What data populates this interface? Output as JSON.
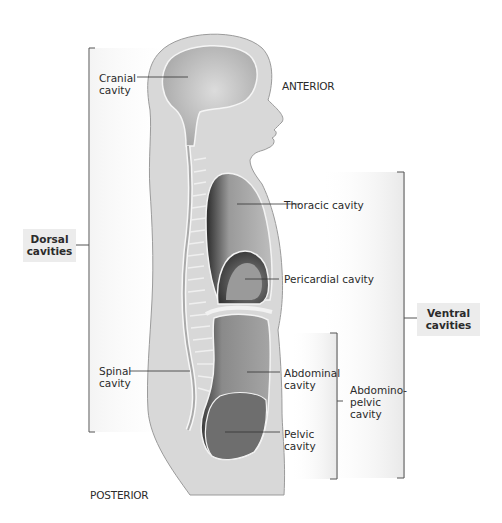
{
  "figure": {
    "orientation": {
      "anterior": "ANTERIOR",
      "posterior": "POSTERIOR"
    },
    "groups": {
      "dorsal": {
        "line1": "Dorsal",
        "line2": "cavities"
      },
      "ventral": {
        "line1": "Ventral",
        "line2": "cavities"
      },
      "abdominopelvic": {
        "line1": "Abdomino-",
        "line2": "pelvic",
        "line3": "cavity"
      }
    },
    "labels": {
      "cranial": {
        "line1": "Cranial",
        "line2": "cavity"
      },
      "spinal": {
        "line1": "Spinal",
        "line2": "cavity"
      },
      "thoracic": {
        "line1": "Thoracic cavity"
      },
      "pericardial": {
        "line1": "Pericardial cavity"
      },
      "abdominal": {
        "line1": "Abdominal",
        "line2": "cavity"
      },
      "pelvic": {
        "line1": "Pelvic",
        "line2": "cavity"
      }
    },
    "colors": {
      "body_fill": "#d6d6d6",
      "body_outline": "#9a9a9a",
      "cavity_light": "#c4c4c4",
      "cavity_dark": "#3e3e3e",
      "organ_fill": "#8f8f8f",
      "label_box": "#ececec",
      "bracket": "#555555"
    }
  }
}
